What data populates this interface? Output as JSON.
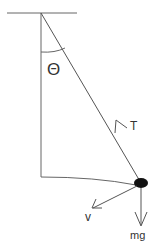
{
  "diagram": {
    "labels": {
      "angle": "Θ",
      "tension": "T",
      "velocity": "v",
      "weight": "mg"
    },
    "colors": {
      "line": "#555555",
      "bob": "#111111",
      "text": "#333333"
    }
  }
}
